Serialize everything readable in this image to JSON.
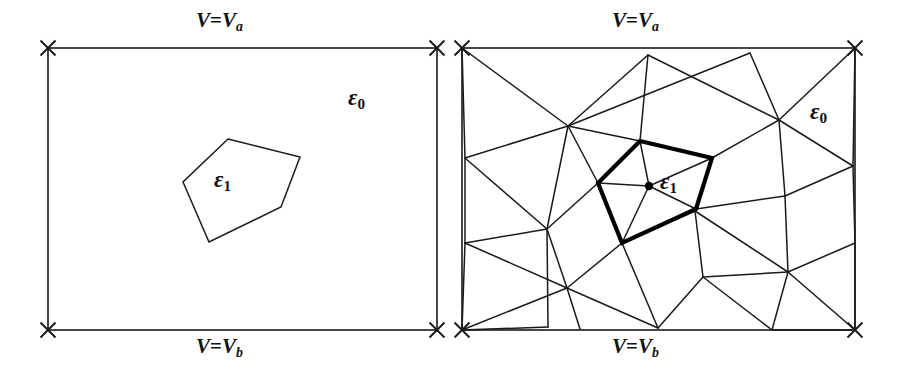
{
  "figure": {
    "background_color": "#ffffff",
    "line_color": "#1a1a1a",
    "bold_line_color": "#000000"
  },
  "panels": [
    {
      "id": "continuous-domain",
      "name": "left-panel",
      "box": {
        "x1": 48,
        "y1": 48,
        "x2": 437,
        "y2": 330
      },
      "labels": {
        "top": {
          "prefix": "V",
          "eq": "=",
          "var": "V",
          "sub": "a",
          "text": "V=Va",
          "x": 196,
          "y": 10
        },
        "bottom": {
          "prefix": "V",
          "eq": "=",
          "var": "V",
          "sub": "b",
          "text": "V=Vb",
          "x": 196,
          "y": 336
        },
        "outer_medium": {
          "sym": "ε",
          "sub": "0",
          "text": "ε0",
          "x": 348,
          "y": 86
        },
        "inner_medium": {
          "sym": "ε",
          "sub": "1",
          "text": "ε1",
          "x": 214,
          "y": 168
        }
      },
      "dielectric_polygon": [
        [
          228,
          139
        ],
        [
          300,
          157
        ],
        [
          281,
          207
        ],
        [
          209,
          242
        ],
        [
          183,
          182
        ]
      ],
      "corner_markers": [
        [
          48,
          48
        ],
        [
          437,
          48
        ],
        [
          48,
          330
        ],
        [
          437,
          330
        ]
      ]
    },
    {
      "id": "meshed-domain",
      "name": "right-panel",
      "box": {
        "x1": 462,
        "y1": 48,
        "x2": 855,
        "y2": 330
      },
      "labels": {
        "top": {
          "prefix": "V",
          "eq": "=",
          "var": "V",
          "sub": "a",
          "text": "V=Va",
          "x": 612,
          "y": 10
        },
        "bottom": {
          "prefix": "V",
          "eq": "=",
          "var": "V",
          "sub": "b",
          "text": "V=Vb",
          "x": 612,
          "y": 336
        },
        "outer_medium": {
          "sym": "ε",
          "sub": "0",
          "text": "ε0",
          "x": 810,
          "y": 100
        },
        "inner_medium": {
          "sym": "ε",
          "sub": "1",
          "text": "ε1",
          "x": 660,
          "y": 170
        }
      },
      "dielectric_polygon": [
        [
          640,
          141
        ],
        [
          712,
          158
        ],
        [
          696,
          209
        ],
        [
          622,
          243
        ],
        [
          598,
          183
        ]
      ],
      "center_node": {
        "x": 649,
        "y": 186,
        "r": 4.2
      },
      "corner_markers": [
        [
          462,
          48
        ],
        [
          855,
          48
        ],
        [
          462,
          330
        ],
        [
          855,
          330
        ]
      ],
      "mesh_nodes": [
        [
          462,
          48
        ],
        [
          648,
          55
        ],
        [
          750,
          53
        ],
        [
          855,
          48
        ],
        [
          568,
          126
        ],
        [
          779,
          120
        ],
        [
          465,
          158
        ],
        [
          853,
          166
        ],
        [
          598,
          183
        ],
        [
          640,
          141
        ],
        [
          712,
          158
        ],
        [
          696,
          209
        ],
        [
          622,
          243
        ],
        [
          649,
          186
        ],
        [
          547,
          229
        ],
        [
          695,
          211
        ],
        [
          785,
          196
        ],
        [
          855,
          243
        ],
        [
          465,
          243
        ],
        [
          567,
          288
        ],
        [
          703,
          277
        ],
        [
          788,
          272
        ],
        [
          462,
          330
        ],
        [
          548,
          327
        ],
        [
          580,
          329
        ],
        [
          658,
          328
        ],
        [
          772,
          330
        ],
        [
          855,
          330
        ]
      ],
      "mesh_edges": [
        [
          [
            462,
            48
          ],
          [
            568,
            126
          ]
        ],
        [
          [
            462,
            48
          ],
          [
            465,
            158
          ]
        ],
        [
          [
            648,
            55
          ],
          [
            568,
            126
          ]
        ],
        [
          [
            648,
            55
          ],
          [
            640,
            141
          ]
        ],
        [
          [
            648,
            55
          ],
          [
            779,
            120
          ]
        ],
        [
          [
            750,
            53
          ],
          [
            779,
            120
          ]
        ],
        [
          [
            750,
            53
          ],
          [
            568,
            126
          ]
        ],
        [
          [
            855,
            48
          ],
          [
            779,
            120
          ]
        ],
        [
          [
            855,
            48
          ],
          [
            853,
            166
          ]
        ],
        [
          [
            568,
            126
          ],
          [
            465,
            158
          ]
        ],
        [
          [
            568,
            126
          ],
          [
            598,
            183
          ]
        ],
        [
          [
            568,
            126
          ],
          [
            547,
            229
          ]
        ],
        [
          [
            568,
            126
          ],
          [
            640,
            141
          ]
        ],
        [
          [
            779,
            120
          ],
          [
            712,
            158
          ]
        ],
        [
          [
            779,
            120
          ],
          [
            853,
            166
          ]
        ],
        [
          [
            779,
            120
          ],
          [
            785,
            196
          ]
        ],
        [
          [
            853,
            166
          ],
          [
            785,
            196
          ]
        ],
        [
          [
            853,
            166
          ],
          [
            855,
            243
          ]
        ],
        [
          [
            465,
            158
          ],
          [
            547,
            229
          ]
        ],
        [
          [
            465,
            158
          ],
          [
            465,
            243
          ]
        ],
        [
          [
            598,
            183
          ],
          [
            547,
            229
          ]
        ],
        [
          [
            598,
            183
          ],
          [
            649,
            186
          ]
        ],
        [
          [
            640,
            141
          ],
          [
            649,
            186
          ]
        ],
        [
          [
            712,
            158
          ],
          [
            649,
            186
          ]
        ],
        [
          [
            696,
            209
          ],
          [
            649,
            186
          ]
        ],
        [
          [
            622,
            243
          ],
          [
            649,
            186
          ]
        ],
        [
          [
            712,
            158
          ],
          [
            695,
            211
          ]
        ],
        [
          [
            696,
            209
          ],
          [
            695,
            211
          ]
        ],
        [
          [
            696,
            209
          ],
          [
            785,
            196
          ]
        ],
        [
          [
            785,
            196
          ],
          [
            788,
            272
          ]
        ],
        [
          [
            855,
            243
          ],
          [
            788,
            272
          ]
        ],
        [
          [
            855,
            243
          ],
          [
            855,
            330
          ]
        ],
        [
          [
            547,
            229
          ],
          [
            465,
            243
          ]
        ],
        [
          [
            547,
            229
          ],
          [
            567,
            288
          ]
        ],
        [
          [
            547,
            229
          ],
          [
            548,
            327
          ]
        ],
        [
          [
            465,
            243
          ],
          [
            567,
            288
          ]
        ],
        [
          [
            622,
            243
          ],
          [
            567,
            288
          ]
        ],
        [
          [
            622,
            243
          ],
          [
            695,
            211
          ]
        ],
        [
          [
            695,
            211
          ],
          [
            703,
            277
          ]
        ],
        [
          [
            695,
            211
          ],
          [
            788,
            272
          ]
        ],
        [
          [
            703,
            277
          ],
          [
            788,
            272
          ]
        ],
        [
          [
            703,
            277
          ],
          [
            658,
            328
          ]
        ],
        [
          [
            703,
            277
          ],
          [
            772,
            330
          ]
        ],
        [
          [
            788,
            272
          ],
          [
            772,
            330
          ]
        ],
        [
          [
            788,
            272
          ],
          [
            855,
            330
          ]
        ],
        [
          [
            567,
            288
          ],
          [
            462,
            330
          ]
        ],
        [
          [
            567,
            288
          ],
          [
            580,
            329
          ]
        ],
        [
          [
            567,
            288
          ],
          [
            658,
            328
          ]
        ],
        [
          [
            465,
            243
          ],
          [
            462,
            330
          ]
        ],
        [
          [
            622,
            243
          ],
          [
            658,
            328
          ]
        ],
        [
          [
            772,
            330
          ],
          [
            855,
            330
          ]
        ],
        [
          [
            548,
            327
          ],
          [
            462,
            330
          ]
        ]
      ]
    }
  ]
}
